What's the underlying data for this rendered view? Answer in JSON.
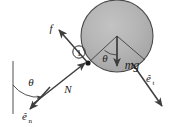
{
  "figure": {
    "background_color": "#ffffff",
    "line_color": "#3d3d3d",
    "ball_fill_color": "#b0b0b0",
    "ball_edge_color": "#4a4a4a",
    "text_color": "#1a1a1a"
  },
  "ball": {
    "label": "ball",
    "center_x": 117,
    "center_y": 36,
    "radius": 36
  },
  "contact_point": {
    "name": "contact-point",
    "x": 88,
    "y": 63
  },
  "marker": {
    "label": "1",
    "x": 79,
    "y": 52,
    "radius": 6
  },
  "labels": {
    "friction": "f",
    "normal": "N",
    "weight": "mg",
    "theta_incline": "θ",
    "theta_ball": "θ",
    "unit_normal_base": "ê",
    "unit_normal_sub": "n",
    "unit_tangent_base": "ê",
    "unit_tangent_sub": "t"
  },
  "vectors": [
    {
      "name": "friction-force",
      "label": "f",
      "from_x": 88,
      "from_y": 63,
      "to_x": 58,
      "to_y": 29
    },
    {
      "name": "normal-force",
      "label": "N",
      "from_x": 34,
      "from_y": 103,
      "to_x": 86,
      "to_y": 62
    },
    {
      "name": "weight-force",
      "label": "mg",
      "from_x": 117,
      "from_y": 36,
      "to_x": 117,
      "to_y": 66
    },
    {
      "name": "unit-vector-normal",
      "label": "ê n",
      "from_x": 49,
      "from_y": 88,
      "to_x": 29,
      "to_y": 110
    },
    {
      "name": "unit-vector-tangent",
      "label": "ê t",
      "from_x": 133,
      "from_y": 64,
      "to_x": 163,
      "to_y": 107
    }
  ],
  "reference_line": {
    "name": "vertical-reference-line",
    "x": 13,
    "y_top": 61,
    "y_bottom": 114
  },
  "angle_arcs": [
    {
      "name": "incline-angle-arc",
      "label": "θ",
      "label_x": 31,
      "label_y": 83
    },
    {
      "name": "ball-angle-arc",
      "label": "θ",
      "label_x": 105,
      "label_y": 60
    }
  ]
}
